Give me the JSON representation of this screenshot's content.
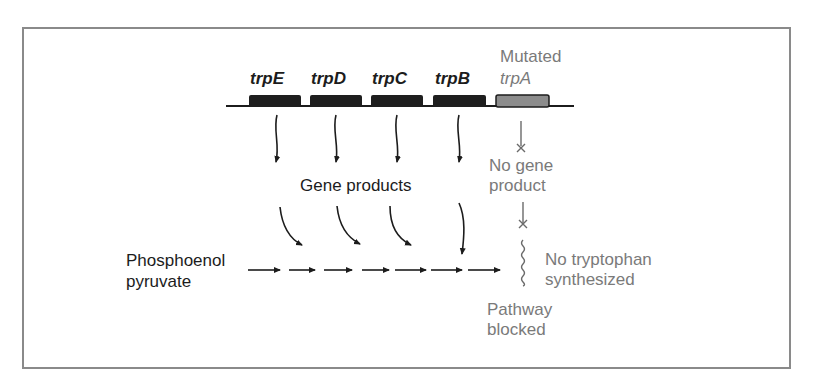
{
  "genes": [
    {
      "label": "trpE",
      "state": "normal",
      "color": "#1e1e1e"
    },
    {
      "label": "trpD",
      "state": "normal",
      "color": "#1e1e1e"
    },
    {
      "label": "trpC",
      "state": "normal",
      "color": "#1e1e1e"
    },
    {
      "label": "trpB",
      "state": "normal",
      "color": "#1e1e1e"
    },
    {
      "label": "trpA",
      "state": "mutated",
      "color": "#8c8c8c"
    }
  ],
  "mutated_label": "Mutated",
  "gene_products_label": "Gene products",
  "no_gene_product": {
    "line1": "No gene",
    "line2": "product"
  },
  "substrate": {
    "line1": "Phosphoenol",
    "line2": "pyruvate"
  },
  "no_tryptophan": {
    "line1": "No tryptophan",
    "line2": "synthesized"
  },
  "pathway_blocked": {
    "line1": "Pathway",
    "line2": "blocked"
  },
  "colors": {
    "normal_text": "#1c1c1c",
    "mutant_text": "#7a7a7a",
    "frame": "#8a8a8a"
  }
}
